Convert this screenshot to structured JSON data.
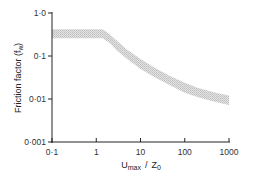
{
  "chart_data": {
    "type": "area",
    "title": "",
    "xlabel": "U_max / Z_0",
    "xlabel_main": "U",
    "xlabel_sub": "max",
    "xlabel_sep": "/",
    "xlabel_den": "Z",
    "xlabel_den_sub": "0",
    "ylabel": "Friction factor (f_w)",
    "ylabel_main": "Friction factor (f",
    "ylabel_sub": "w",
    "ylabel_end": ")",
    "xscale": "log",
    "yscale": "log",
    "xlim": [
      0.1,
      1000
    ],
    "ylim": [
      0.001,
      1.0
    ],
    "grid": false,
    "legend": "none",
    "x_ticks": [
      0.1,
      1,
      10,
      100,
      1000
    ],
    "x_tick_labels": [
      "0·1",
      "1",
      "10",
      "100",
      "1000"
    ],
    "y_ticks": [
      0.001,
      0.01,
      0.1,
      1.0
    ],
    "y_tick_labels": [
      "0·001",
      "0·01",
      "0·1",
      "1·0"
    ],
    "band_fill": "#cfcfcf",
    "axis_color": "#222222",
    "series": [
      {
        "name": "friction factor band (upper)",
        "x": [
          0.1,
          0.5,
          1.0,
          1.4,
          2,
          3,
          5,
          10,
          20,
          50,
          100,
          200,
          500,
          1000
        ],
        "values": [
          0.42,
          0.42,
          0.42,
          0.42,
          0.32,
          0.22,
          0.14,
          0.085,
          0.055,
          0.033,
          0.024,
          0.018,
          0.014,
          0.012
        ]
      },
      {
        "name": "friction factor band (lower)",
        "x": [
          0.1,
          0.5,
          1.0,
          1.4,
          2,
          3,
          5,
          10,
          20,
          50,
          100,
          200,
          500,
          1000
        ],
        "values": [
          0.26,
          0.26,
          0.26,
          0.26,
          0.2,
          0.13,
          0.085,
          0.05,
          0.033,
          0.02,
          0.014,
          0.011,
          0.0085,
          0.0072
        ]
      }
    ]
  }
}
